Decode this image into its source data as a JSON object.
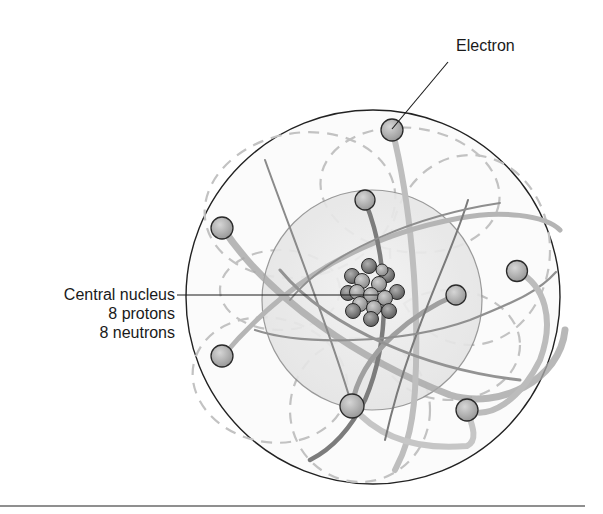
{
  "diagram": {
    "labels": {
      "electron": "Electron",
      "nucleus_line1": "Central nucleus",
      "nucleus_line2": "8 protons",
      "nucleus_line3": "8 neutrons"
    },
    "particles": {
      "protons": 8,
      "neutrons": 8,
      "electrons": 8
    },
    "colors": {
      "outer_circle": "#222222",
      "inner_sphere_fill": "#ececec",
      "inner_sphere_stroke": "#8a8a8a",
      "electron_fill": "#a8a8a8",
      "electron_stroke": "#2a2a2a",
      "nucleus_dark": "#6e6e6e",
      "nucleus_light": "#9a9a9a",
      "orbit_light": "#c4c4c4",
      "orbit_dark": "#8c8c8c",
      "dashed_orbit": "#bdbdbd",
      "baseline": "#8f8f8f"
    }
  }
}
